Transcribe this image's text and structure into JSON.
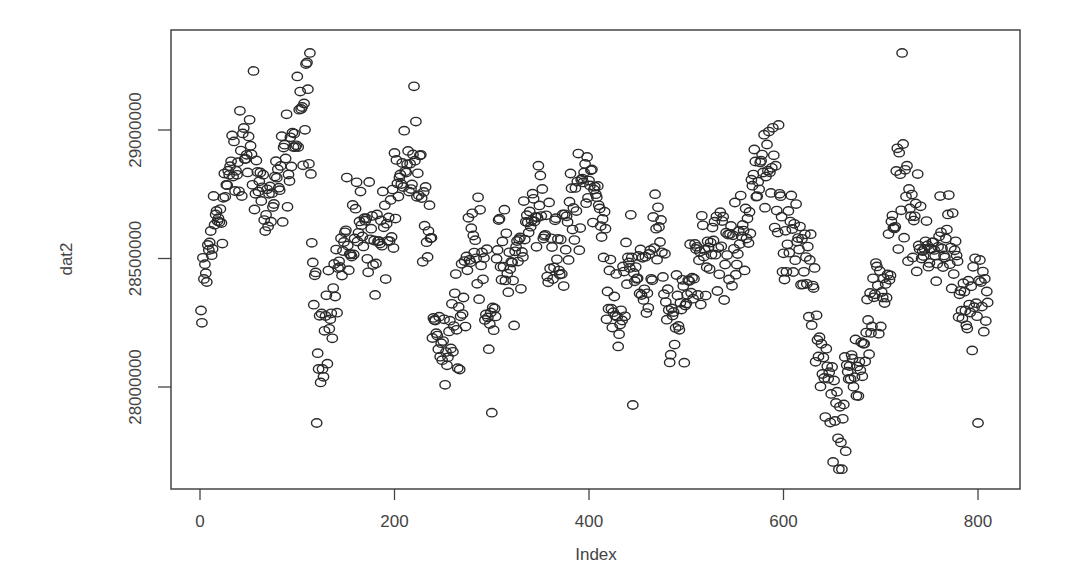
{
  "chart_data": {
    "type": "scatter",
    "title": "",
    "xlabel": "Index",
    "ylabel": "dat2",
    "xlim": [
      -10,
      845
    ],
    "ylim": [
      27650000,
      29350000
    ],
    "x_ticks": [
      0,
      200,
      400,
      600,
      800
    ],
    "x_tick_labels": [
      "0",
      "200",
      "400",
      "600",
      "800"
    ],
    "y_ticks": [
      28000000,
      28500000,
      29000000
    ],
    "y_tick_labels": [
      "28000000",
      "28500000",
      "29000000"
    ],
    "grid": false,
    "legend": null,
    "marker": "open-circle",
    "n_points": 810,
    "anchor_index_step": 10,
    "anchor_values_millions": [
      28.25,
      28.55,
      28.7,
      28.82,
      28.85,
      28.95,
      28.8,
      28.68,
      28.75,
      28.9,
      29.0,
      29.1,
      28.15,
      28.3,
      28.42,
      28.55,
      28.62,
      28.68,
      28.52,
      28.6,
      28.68,
      28.8,
      28.88,
      28.7,
      28.35,
      28.15,
      28.25,
      28.38,
      28.62,
      28.45,
      28.3,
      28.52,
      28.42,
      28.55,
      28.65,
      28.72,
      28.55,
      28.48,
      28.65,
      28.78,
      28.85,
      28.68,
      28.45,
      28.3,
      28.42,
      28.5,
      28.38,
      28.62,
      28.3,
      28.2,
      28.38,
      28.5,
      28.55,
      28.6,
      28.48,
      28.55,
      28.65,
      28.75,
      28.88,
      28.85,
      28.6,
      28.55,
      28.5,
      28.35,
      28.1,
      27.95,
      27.85,
      28.05,
      28.18,
      28.25,
      28.4,
      28.45,
      28.85,
      28.7,
      28.55,
      28.5,
      28.58,
      28.6,
      28.35,
      28.3,
      28.35
    ],
    "noise_amplitude_millions": 0.12,
    "notable_points": [
      {
        "index": 2,
        "value": 28250000
      },
      {
        "index": 55,
        "value": 29230000
      },
      {
        "index": 113,
        "value": 29300000
      },
      {
        "index": 120,
        "value": 27860000
      },
      {
        "index": 220,
        "value": 29170000
      },
      {
        "index": 300,
        "value": 27900000
      },
      {
        "index": 445,
        "value": 27930000
      },
      {
        "index": 595,
        "value": 29020000
      },
      {
        "index": 660,
        "value": 27680000
      },
      {
        "index": 722,
        "value": 29300000
      },
      {
        "index": 800,
        "value": 27860000
      }
    ]
  },
  "plot_box": {
    "left": 171,
    "top": 30,
    "right": 1020,
    "bottom": 489
  },
  "colors": {
    "marker_stroke": "#2a2a2a",
    "axis": "#444444",
    "background": "#ffffff"
  }
}
